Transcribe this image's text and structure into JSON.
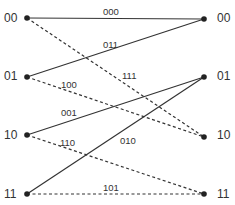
{
  "diagram": {
    "type": "trellis",
    "colors": {
      "line": "#333333",
      "node": "#222222",
      "text": "#333333"
    },
    "left_states": [
      {
        "id": "L00",
        "label": "00",
        "x": 27,
        "y": 18
      },
      {
        "id": "L01",
        "label": "01",
        "x": 27,
        "y": 77
      },
      {
        "id": "L10",
        "label": "10",
        "x": 27,
        "y": 135
      },
      {
        "id": "L11",
        "label": "11",
        "x": 27,
        "y": 194
      }
    ],
    "right_states": [
      {
        "id": "R00",
        "label": "00",
        "x": 204,
        "y": 19
      },
      {
        "id": "R01",
        "label": "01",
        "x": 204,
        "y": 77
      },
      {
        "id": "R10",
        "label": "10",
        "x": 204,
        "y": 137
      },
      {
        "id": "R11",
        "label": "11",
        "x": 204,
        "y": 194
      }
    ],
    "edges": [
      {
        "from": "L00",
        "to": "R00",
        "label": "000",
        "style": "solid",
        "label_x": 103,
        "label_y": 9
      },
      {
        "from": "L00",
        "to": "R10",
        "label": "111",
        "style": "dashed",
        "label_x": 122,
        "label_y": 73
      },
      {
        "from": "L01",
        "to": "R00",
        "label": "011",
        "style": "solid",
        "label_x": 104,
        "label_y": 41
      },
      {
        "from": "L01",
        "to": "R10",
        "label": "100",
        "style": "dashed",
        "label_x": 62,
        "label_y": 81
      },
      {
        "from": "L10",
        "to": "R01",
        "label": "001",
        "style": "solid",
        "label_x": 62,
        "label_y": 110
      },
      {
        "from": "L10",
        "to": "R11",
        "label": "110",
        "style": "dashed",
        "label_x": 60,
        "label_y": 139
      },
      {
        "from": "L11",
        "to": "R01",
        "label": "010",
        "style": "solid",
        "label_x": 120,
        "label_y": 136
      },
      {
        "from": "L11",
        "to": "R11",
        "label": "101",
        "style": "dashed",
        "label_x": 103,
        "label_y": 184
      }
    ]
  },
  "labels": {
    "left": [
      "00",
      "01",
      "10",
      "11"
    ],
    "right": [
      "00",
      "01",
      "10",
      "11"
    ],
    "edges": [
      "000",
      "111",
      "011",
      "100",
      "001",
      "110",
      "010",
      "101"
    ]
  }
}
